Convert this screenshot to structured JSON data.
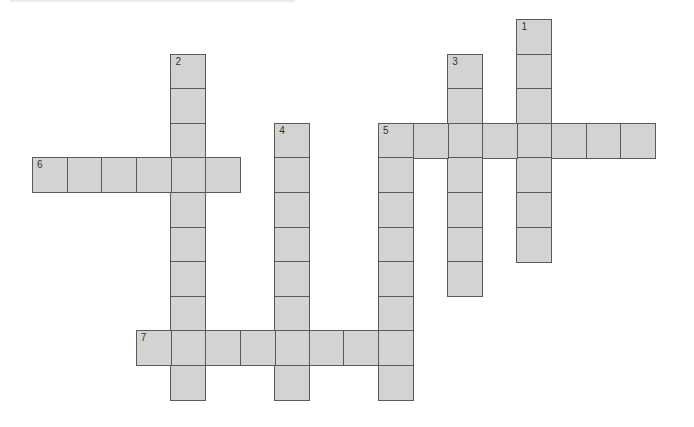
{
  "puzzle": {
    "type": "crossword",
    "grid": {
      "origin_x": 32,
      "origin_y": 19,
      "cell_pitch": 34.6,
      "cell_fill": "#d3d3d3",
      "cell_border": "#5a5a5a"
    },
    "words": [
      {
        "number": "1",
        "direction": "down",
        "col": 14,
        "row": 0,
        "length": 7
      },
      {
        "number": "2",
        "direction": "down",
        "col": 4,
        "row": 1,
        "length": 10
      },
      {
        "number": "3",
        "direction": "down",
        "col": 12,
        "row": 1,
        "length": 7
      },
      {
        "number": "4",
        "direction": "down",
        "col": 7,
        "row": 3,
        "length": 8
      },
      {
        "number": "5",
        "direction": "across",
        "col": 10,
        "row": 3,
        "length": 8
      },
      {
        "number": "5",
        "direction": "down",
        "col": 10,
        "row": 3,
        "length": 8
      },
      {
        "number": "6",
        "direction": "across",
        "col": 0,
        "row": 4,
        "length": 6
      },
      {
        "number": "7",
        "direction": "across",
        "col": 3,
        "row": 9,
        "length": 8
      }
    ],
    "clue_numbers": [
      {
        "number": "1",
        "col": 14,
        "row": 0
      },
      {
        "number": "2",
        "col": 4,
        "row": 1
      },
      {
        "number": "3",
        "col": 12,
        "row": 1
      },
      {
        "number": "4",
        "col": 7,
        "row": 3
      },
      {
        "number": "5",
        "col": 10,
        "row": 3
      },
      {
        "number": "6",
        "col": 0,
        "row": 4
      },
      {
        "number": "7",
        "col": 3,
        "row": 9
      }
    ]
  }
}
